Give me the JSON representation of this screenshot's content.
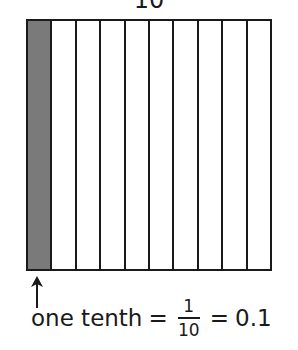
{
  "diagram": {
    "top_label": "10",
    "grid": {
      "columns": 10,
      "shaded_columns": [
        0
      ],
      "shade_color": "#7a7a7a",
      "line_color": "#1a1a1a"
    },
    "caption": {
      "words": "one tenth",
      "equals1": "=",
      "numerator": "1",
      "denominator": "10",
      "equals2": "=",
      "decimal": "0.1"
    },
    "arrow_icon": "arrow-up-icon"
  }
}
